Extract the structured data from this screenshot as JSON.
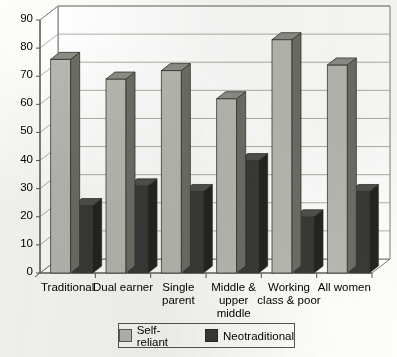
{
  "chart_data": {
    "type": "bar",
    "title": "",
    "subtitle": "",
    "xlabel": "",
    "ylabel": "",
    "ylim": [
      0,
      90
    ],
    "ytick_step": 10,
    "yticks": [
      "0",
      "10",
      "20",
      "30",
      "40",
      "50",
      "60",
      "70",
      "80",
      "90"
    ],
    "grid": true,
    "grid_axis": "y",
    "legend_position": "bottom",
    "style": "3d-perspective-columns",
    "categories": [
      "Traditional",
      "Dual earner",
      "Single parent",
      "Middle & upper middle",
      "Working class & poor",
      "All women"
    ],
    "category_label_lines": [
      [
        "Traditional"
      ],
      [
        "Dual earner"
      ],
      [
        "Single",
        "parent"
      ],
      [
        "Middle &",
        "upper",
        "middle"
      ],
      [
        "Working",
        "class & poor"
      ],
      [
        "All women"
      ]
    ],
    "series": [
      {
        "name": "Self-reliant",
        "color": "#b9b9b4",
        "side_color": "#6e6e68",
        "top_color": "#8e8e88",
        "values": [
          76,
          69,
          72,
          62,
          83,
          74
        ]
      },
      {
        "name": "Neotraditional",
        "color": "#3a3a38",
        "side_color": "#242423",
        "top_color": "#4f4f4c",
        "values": [
          24,
          31,
          29,
          40,
          20,
          29
        ]
      }
    ],
    "legend_entries": [
      {
        "label": "Self-reliant",
        "swatch": "#b9b9b4"
      },
      {
        "label": "Neotraditional",
        "swatch": "#3a3a38"
      }
    ]
  },
  "colors": {
    "axis": "#55554e",
    "grid": "#9a9a92",
    "frame": "#6d6d66",
    "text": "#15150e",
    "background": "#fdfdfb",
    "legend_border": "#56564f"
  }
}
